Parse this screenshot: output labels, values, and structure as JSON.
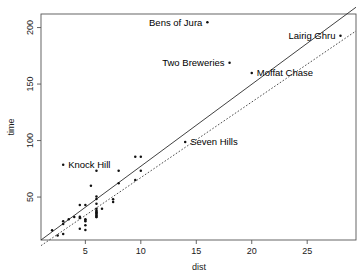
{
  "chart_data": {
    "type": "scatter",
    "title": "",
    "xlabel": "dist",
    "ylabel": "time",
    "xlim": [
      1.0,
      29.4
    ],
    "ylim": [
      12,
      212
    ],
    "grid": false,
    "legend": "none",
    "xticks": [
      5,
      10,
      15,
      20,
      25
    ],
    "xticklabels": [
      "5",
      "10",
      "15",
      "20",
      "25"
    ],
    "yticks": [
      50,
      100,
      150,
      200
    ],
    "yticklabels": [
      "50",
      "100",
      "150",
      "200"
    ],
    "series": [
      {
        "name": "hill races",
        "marker": "point",
        "points": [
          {
            "x": 2.5,
            "y": 16.083,
            "label": ""
          },
          {
            "x": 6.0,
            "y": 48.35,
            "label": ""
          },
          {
            "x": 6.0,
            "y": 33.65,
            "label": ""
          },
          {
            "x": 7.5,
            "y": 45.6,
            "label": ""
          },
          {
            "x": 8.0,
            "y": 62.267,
            "label": ""
          },
          {
            "x": 6.0,
            "y": 73.217,
            "label": ""
          },
          {
            "x": 5.0,
            "y": 28.567,
            "label": ""
          },
          {
            "x": 6.0,
            "y": 50.5,
            "label": ""
          },
          {
            "x": 5.0,
            "y": 20.95,
            "label": ""
          },
          {
            "x": 9.5,
            "y": 85.583,
            "label": ""
          },
          {
            "x": 6.0,
            "y": 32.383,
            "label": ""
          },
          {
            "x": 4.5,
            "y": 31.383,
            "label": ""
          },
          {
            "x": 10.0,
            "y": 85.75,
            "label": ""
          },
          {
            "x": 6.0,
            "y": 32.383,
            "label": ""
          },
          {
            "x": 3.0,
            "y": 78.65,
            "label": "Knock Hill"
          },
          {
            "x": 4.5,
            "y": 43.05,
            "label": ""
          },
          {
            "x": 5.5,
            "y": 60.0,
            "label": ""
          },
          {
            "x": 3.0,
            "y": 26.217,
            "label": ""
          },
          {
            "x": 3.5,
            "y": 30.4,
            "label": ""
          },
          {
            "x": 6.0,
            "y": 34.433,
            "label": ""
          },
          {
            "x": 2.0,
            "y": 20.7,
            "label": ""
          },
          {
            "x": 3.0,
            "y": 28.567,
            "label": ""
          },
          {
            "x": 4.0,
            "y": 32.383,
            "label": ""
          },
          {
            "x": 6.0,
            "y": 37.0,
            "label": ""
          },
          {
            "x": 5.0,
            "y": 30.4,
            "label": ""
          },
          {
            "x": 6.5,
            "y": 39.75,
            "label": ""
          },
          {
            "x": 5.0,
            "y": 25.0,
            "label": ""
          },
          {
            "x": 10.0,
            "y": 73.217,
            "label": ""
          },
          {
            "x": 6.0,
            "y": 35.75,
            "label": ""
          },
          {
            "x": 18.0,
            "y": 168.85,
            "label": "Two Breweries"
          },
          {
            "x": 4.5,
            "y": 32.567,
            "label": ""
          },
          {
            "x": 20.0,
            "y": 159.833,
            "label": "Moffat Chase"
          },
          {
            "x": 5.0,
            "y": 43.05,
            "label": ""
          },
          {
            "x": 6.0,
            "y": 39.75,
            "label": ""
          },
          {
            "x": 6.0,
            "y": 38.2,
            "label": ""
          },
          {
            "x": 7.5,
            "y": 48.0,
            "label": ""
          },
          {
            "x": 8.0,
            "y": 73.217,
            "label": ""
          },
          {
            "x": 16.0,
            "y": 204.617,
            "label": "Bens of Jura"
          },
          {
            "x": 6.0,
            "y": 36.367,
            "label": ""
          },
          {
            "x": 5.0,
            "y": 29.75,
            "label": ""
          },
          {
            "x": 14.0,
            "y": 98.8,
            "label": "Seven Hills"
          },
          {
            "x": 3.0,
            "y": 17.417,
            "label": ""
          },
          {
            "x": 4.5,
            "y": 22.0,
            "label": ""
          },
          {
            "x": 28.0,
            "y": 192.667,
            "label": "Lairig Ghru"
          },
          {
            "x": 9.5,
            "y": 65.0,
            "label": ""
          },
          {
            "x": 6.0,
            "y": 44.133,
            "label": ""
          }
        ]
      }
    ],
    "lines": [
      {
        "name": "least-squares-fit",
        "style": "solid",
        "x0": 1.0,
        "y0": 12.0,
        "x1": 29.4,
        "y1": 218.0
      },
      {
        "name": "robust-fit",
        "style": "dashed",
        "x0": 1.0,
        "y0": 7.0,
        "x1": 29.4,
        "y1": 197.0
      }
    ],
    "point_labels": [
      {
        "text": "Bens of Jura",
        "x": 16.0,
        "y": 204.617,
        "anchor": "end"
      },
      {
        "text": "Lairig Ghru",
        "x": 28.0,
        "y": 192.667,
        "anchor": "end"
      },
      {
        "text": "Two Breweries",
        "x": 18.0,
        "y": 168.85,
        "anchor": "end"
      },
      {
        "text": "Moffat Chase",
        "x": 20.0,
        "y": 159.833,
        "anchor": "start"
      },
      {
        "text": "Seven Hills",
        "x": 14.0,
        "y": 98.8,
        "anchor": "start"
      },
      {
        "text": "Knock Hill",
        "x": 3.0,
        "y": 78.65,
        "anchor": "start"
      }
    ]
  },
  "axes": {
    "x_title": "dist",
    "y_title": "time"
  }
}
